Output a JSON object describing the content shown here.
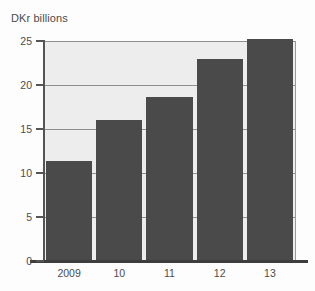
{
  "chart_data": {
    "type": "bar",
    "title": "DKr billions",
    "xlabel": "",
    "ylabel": "",
    "categories": [
      "2009",
      "10",
      "11",
      "12",
      "13"
    ],
    "values": [
      11.4,
      16.0,
      18.6,
      23.0,
      25.2
    ],
    "ylim": [
      0,
      25
    ],
    "yticks": [
      0,
      5,
      10,
      15,
      20,
      25
    ],
    "ytick_labels": [
      "0",
      "5",
      "10",
      "15",
      "20",
      "25"
    ],
    "grid": true,
    "legend": null,
    "series": [
      {
        "name": "DKr billions",
        "values": [
          11.4,
          16.0,
          18.6,
          23.0,
          25.2
        ]
      }
    ],
    "colors": {
      "bar": "#4a4a4a",
      "plot_background": "#ededed",
      "gridline": "#8e8e8e",
      "axis": "#4a4a4a",
      "text": "#4c4c4c",
      "page_background": "#fdfdfd"
    }
  }
}
